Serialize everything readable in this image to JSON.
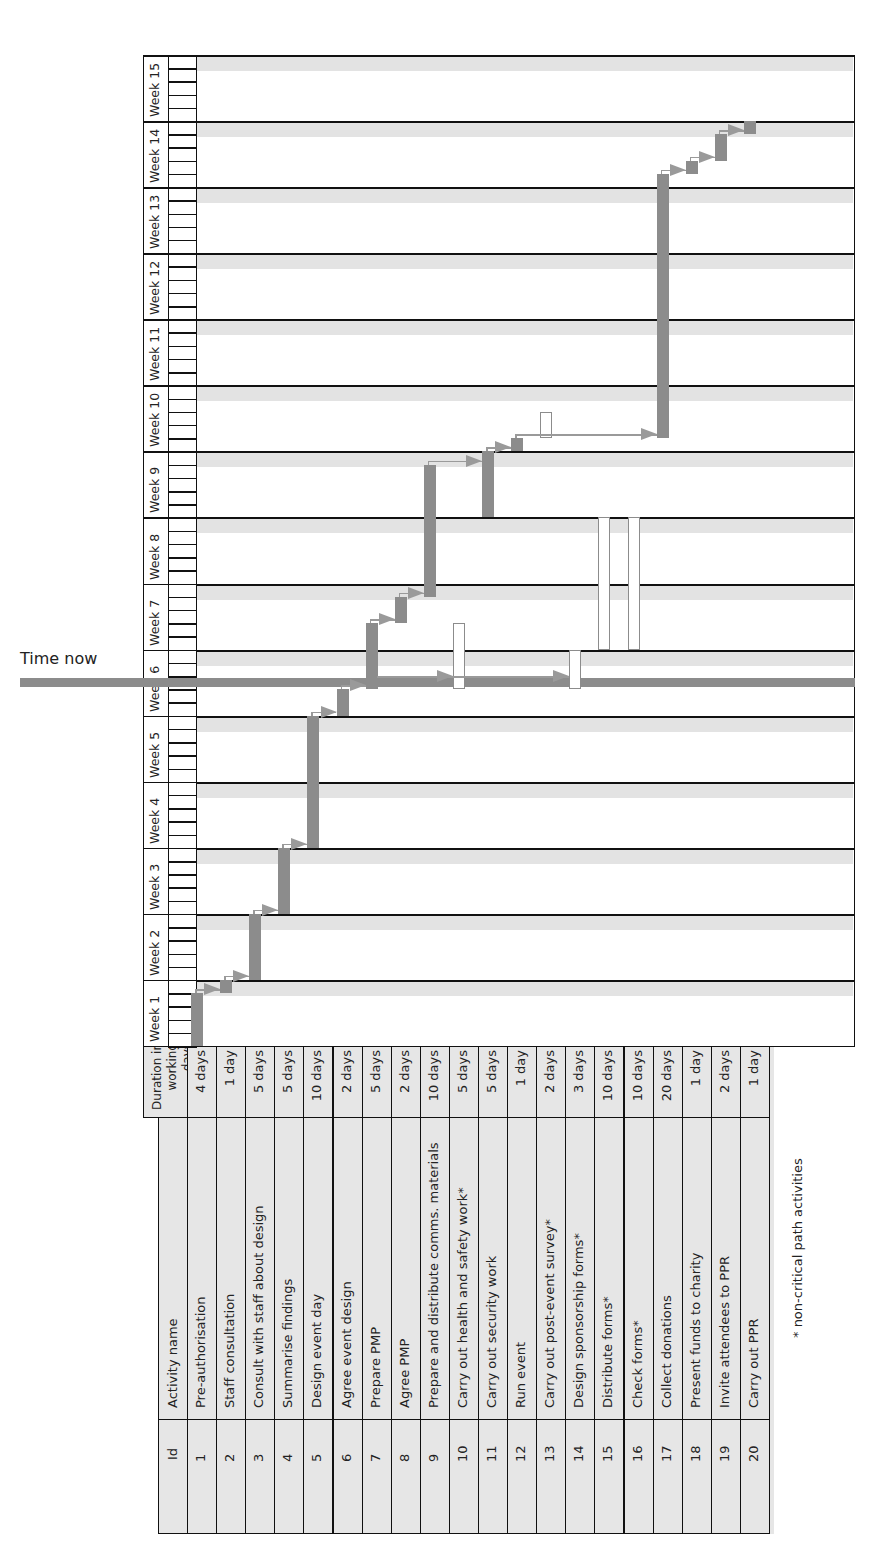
{
  "time_now_label": "Time now",
  "footnote": "* non-critical path activities",
  "table": {
    "headers": {
      "id": "Id",
      "name": "Activity name",
      "duration": "Duration in working days"
    },
    "rows": [
      {
        "id": "1",
        "name": "Pre-authorisation",
        "duration": "4 days"
      },
      {
        "id": "2",
        "name": "Staff consultation",
        "duration": "1 day"
      },
      {
        "id": "3",
        "name": "Consult with staff about design",
        "duration": "5 days"
      },
      {
        "id": "4",
        "name": "Summarise findings",
        "duration": "5 days"
      },
      {
        "id": "5",
        "name": "Design event day",
        "duration": "10 days"
      },
      {
        "id": "6",
        "name": "Agree event design",
        "duration": "2 days"
      },
      {
        "id": "7",
        "name": "Prepare PMP",
        "duration": "5 days"
      },
      {
        "id": "8",
        "name": "Agree PMP",
        "duration": "2 days"
      },
      {
        "id": "9",
        "name": "Prepare and distribute comms. materials",
        "duration": "10 days"
      },
      {
        "id": "10",
        "name": "Carry out health and safety work*",
        "duration": "5 days"
      },
      {
        "id": "11",
        "name": "Carry out security work",
        "duration": "5 days"
      },
      {
        "id": "12",
        "name": "Run event",
        "duration": "1 day"
      },
      {
        "id": "13",
        "name": "Carry out post-event survey*",
        "duration": "2 days"
      },
      {
        "id": "14",
        "name": "Design sponsorship forms*",
        "duration": "3 days"
      },
      {
        "id": "15",
        "name": "Distribute forms*",
        "duration": "10 days"
      },
      {
        "id": "16",
        "name": "Check forms*",
        "duration": "10 days"
      },
      {
        "id": "17",
        "name": "Collect donations",
        "duration": "20 days"
      },
      {
        "id": "18",
        "name": "Present funds to charity",
        "duration": "1 day"
      },
      {
        "id": "19",
        "name": "Invite attendees to PPR",
        "duration": "2 days"
      },
      {
        "id": "20",
        "name": "Carry out PPR",
        "duration": "1 day"
      }
    ]
  },
  "weeks": [
    "Week 1",
    "Week 2",
    "Week 3",
    "Week 4",
    "Week 5",
    "Week 6",
    "Week 7",
    "Week 8",
    "Week 9",
    "Week 10",
    "Week 11",
    "Week 12",
    "Week 13",
    "Week 14",
    "Week 15"
  ],
  "colors": {
    "critical": "#8c8c8c",
    "non_critical_fill": "#ffffff",
    "table_bg": "#e6e6e6",
    "band": "#e3e3e3",
    "grid": "#111111"
  },
  "chart_data": {
    "type": "gantt",
    "title": "",
    "orientation": "rotated 90° counter-clockwise (time runs bottom to top)",
    "time_unit": "working days (5 per week)",
    "x_ticks": [
      "Week 1",
      "Week 2",
      "Week 3",
      "Week 4",
      "Week 5",
      "Week 6",
      "Week 7",
      "Week 8",
      "Week 9",
      "Week 10",
      "Week 11",
      "Week 12",
      "Week 13",
      "Week 14",
      "Week 15"
    ],
    "time_now_day": 27.5,
    "time_now_label": "Time now",
    "legend": "* non-critical path activities",
    "tasks": [
      {
        "id": 1,
        "name": "Pre-authorisation",
        "start": 0,
        "duration": 4,
        "critical": true
      },
      {
        "id": 2,
        "name": "Staff consultation",
        "start": 4,
        "duration": 1,
        "critical": true
      },
      {
        "id": 3,
        "name": "Consult with staff about design",
        "start": 5,
        "duration": 5,
        "critical": true
      },
      {
        "id": 4,
        "name": "Summarise findings",
        "start": 10,
        "duration": 5,
        "critical": true
      },
      {
        "id": 5,
        "name": "Design event day",
        "start": 15,
        "duration": 10,
        "critical": true
      },
      {
        "id": 6,
        "name": "Agree event design",
        "start": 25,
        "duration": 2,
        "critical": true
      },
      {
        "id": 7,
        "name": "Prepare PMP",
        "start": 27,
        "duration": 5,
        "critical": true
      },
      {
        "id": 8,
        "name": "Agree PMP",
        "start": 32,
        "duration": 2,
        "critical": true
      },
      {
        "id": 9,
        "name": "Prepare and distribute comms. materials",
        "start": 34,
        "duration": 10,
        "critical": true
      },
      {
        "id": 10,
        "name": "Carry out health and safety work*",
        "start": 27,
        "duration": 5,
        "critical": false
      },
      {
        "id": 11,
        "name": "Carry out security work",
        "start": 40,
        "duration": 5,
        "critical": true
      },
      {
        "id": 12,
        "name": "Run event",
        "start": 45,
        "duration": 1,
        "critical": true
      },
      {
        "id": 13,
        "name": "Carry out post-event survey*",
        "start": 46,
        "duration": 2,
        "critical": false
      },
      {
        "id": 14,
        "name": "Design sponsorship forms*",
        "start": 27,
        "duration": 3,
        "critical": false
      },
      {
        "id": 15,
        "name": "Distribute forms*",
        "start": 30,
        "duration": 10,
        "critical": false
      },
      {
        "id": 16,
        "name": "Check forms*",
        "start": 30,
        "duration": 10,
        "critical": false
      },
      {
        "id": 17,
        "name": "Collect donations",
        "start": 46,
        "duration": 20,
        "critical": true
      },
      {
        "id": 18,
        "name": "Present funds to charity",
        "start": 66,
        "duration": 1,
        "critical": true
      },
      {
        "id": 19,
        "name": "Invite attendees to PPR",
        "start": 67,
        "duration": 2,
        "critical": true
      },
      {
        "id": 20,
        "name": "Carry out PPR",
        "start": 69,
        "duration": 1,
        "critical": true
      }
    ]
  }
}
